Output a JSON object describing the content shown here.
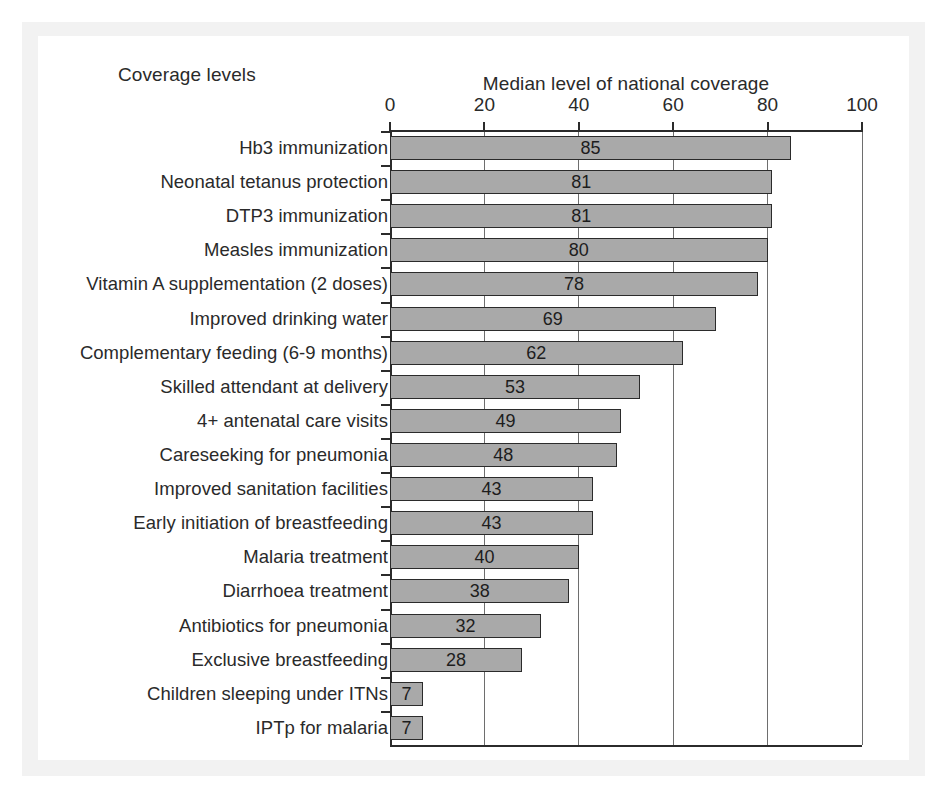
{
  "figure": {
    "left_header": "Coverage levels",
    "axis_title": "Median level of national coverage"
  },
  "chart_data": {
    "type": "bar",
    "orientation": "horizontal",
    "title": "Median level of national coverage",
    "xlabel": "Median level of national coverage",
    "ylabel": "Coverage levels",
    "xlim": [
      0,
      100
    ],
    "xticks": [
      0,
      20,
      40,
      60,
      80,
      100
    ],
    "xtick_labels": [
      "0",
      "20",
      "40",
      "60",
      "80",
      "100"
    ],
    "grid": "vertical",
    "legend": "none",
    "bar_color": "#a9a9a9",
    "bar_edge_color": "#2b2b2b",
    "data_labels": "inside-center",
    "categories": [
      "Hb3 immunization",
      "Neonatal tetanus protection",
      "DTP3 immunization",
      "Measles immunization",
      "Vitamin A supplementation (2 doses)",
      "Improved drinking water",
      "Complementary feeding (6-9 months)",
      "Skilled attendant at delivery",
      "4+ antenatal care visits",
      "Careseeking for pneumonia",
      "Improved sanitation facilities",
      "Early initiation of breastfeeding",
      "Malaria treatment",
      "Diarrhoea treatment",
      "Antibiotics for pneumonia",
      "Exclusive breastfeeding",
      "Children sleeping under ITNs",
      "IPTp for malaria"
    ],
    "values": [
      85,
      81,
      81,
      80,
      78,
      69,
      62,
      53,
      49,
      48,
      43,
      43,
      40,
      38,
      32,
      28,
      7,
      7
    ],
    "value_labels": [
      "85",
      "81",
      "81",
      "80",
      "78",
      "69",
      "62",
      "53",
      "49",
      "48",
      "43",
      "43",
      "40",
      "38",
      "32",
      "28",
      "7",
      "7"
    ]
  }
}
